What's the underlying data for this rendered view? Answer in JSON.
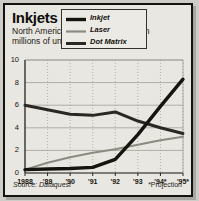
{
  "title": "Inkjets Take Over",
  "subtitle": "North American printer shipments, in millions of units",
  "source": "Source: Dataquest",
  "projection_note": "*Projection",
  "colors": {
    "ink": "#16140f",
    "laser": "#8d8a82",
    "dot": "#2b2824",
    "frame": "#15130f",
    "panel": "#e9e7e1",
    "grid": "#9a978f"
  },
  "legend": [
    {
      "label": "Inkjet",
      "key": "ink",
      "color": "#16140f",
      "weight": 3.4
    },
    {
      "label": "Laser",
      "key": "laser",
      "color": "#8d8a82",
      "weight": 2.0
    },
    {
      "label": "Dot Matrix",
      "key": "dot",
      "color": "#2b2824",
      "weight": 3.0
    }
  ],
  "chart_data": {
    "type": "line",
    "title": "Inkjets Take Over",
    "subtitle": "North American printer shipments, in millions of units",
    "xlabel": "",
    "ylabel": "Millions of units",
    "categories": [
      "1988",
      "'89",
      "'90",
      "'91",
      "'92",
      "'93",
      "'94*",
      "'95*"
    ],
    "xtick_labels": [
      "1988",
      "'89",
      "'90",
      "'91",
      "'92",
      "'93",
      "'94*",
      "'95*"
    ],
    "ytick_labels": [
      "0",
      "2",
      "4",
      "6",
      "8",
      "10"
    ],
    "yticks": [
      0,
      2,
      4,
      6,
      8,
      10
    ],
    "ylim": [
      0,
      10
    ],
    "grid": true,
    "legend_position": "top-center",
    "series": [
      {
        "name": "Inkjet",
        "values": [
          0.3,
          0.35,
          0.4,
          0.5,
          1.2,
          3.4,
          5.9,
          8.3
        ]
      },
      {
        "name": "Laser",
        "values": [
          0.3,
          0.9,
          1.4,
          1.8,
          2.1,
          2.5,
          2.9,
          3.2
        ]
      },
      {
        "name": "Dot Matrix",
        "values": [
          6.0,
          5.6,
          5.2,
          5.1,
          5.4,
          4.6,
          4.0,
          3.5
        ]
      }
    ],
    "annotations": [
      "*Projection"
    ],
    "source": "Source: Dataquest"
  }
}
